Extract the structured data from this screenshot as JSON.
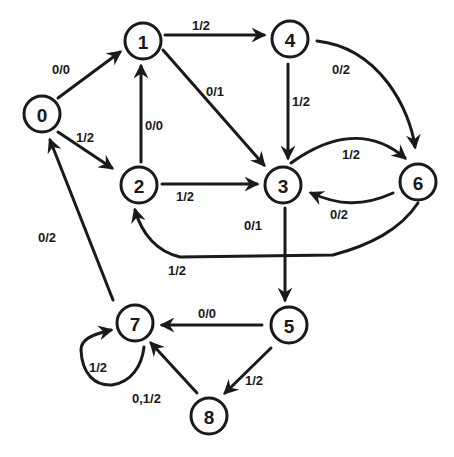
{
  "diagram": {
    "type": "directed-graph",
    "nodes": [
      {
        "id": "0",
        "label": "0",
        "x": 42,
        "y": 114
      },
      {
        "id": "1",
        "label": "1",
        "x": 143,
        "y": 41
      },
      {
        "id": "2",
        "label": "2",
        "x": 139,
        "y": 185
      },
      {
        "id": "3",
        "label": "3",
        "x": 283,
        "y": 185
      },
      {
        "id": "4",
        "label": "4",
        "x": 290,
        "y": 39
      },
      {
        "id": "5",
        "label": "5",
        "x": 289,
        "y": 325
      },
      {
        "id": "6",
        "label": "6",
        "x": 418,
        "y": 182
      },
      {
        "id": "7",
        "label": "7",
        "x": 135,
        "y": 323
      },
      {
        "id": "8",
        "label": "8",
        "x": 209,
        "y": 416
      }
    ],
    "edges": [
      {
        "from": "0",
        "to": "1",
        "label": "0/0"
      },
      {
        "from": "0",
        "to": "2",
        "label": "1/2"
      },
      {
        "from": "1",
        "to": "4",
        "label": "1/2"
      },
      {
        "from": "1",
        "to": "3",
        "label": "0/1"
      },
      {
        "from": "2",
        "to": "1",
        "label": "0/0"
      },
      {
        "from": "2",
        "to": "3",
        "label": "1/2"
      },
      {
        "from": "4",
        "to": "3",
        "label": "1/2"
      },
      {
        "from": "4",
        "to": "6",
        "label": "0/2"
      },
      {
        "from": "3",
        "to": "6",
        "label": "1/2"
      },
      {
        "from": "6",
        "to": "3",
        "label": "0/2"
      },
      {
        "from": "6",
        "to": "2",
        "label": "1/2"
      },
      {
        "from": "3",
        "to": "5",
        "label": "0/1"
      },
      {
        "from": "5",
        "to": "7",
        "label": "0/0"
      },
      {
        "from": "5",
        "to": "8",
        "label": "1/2"
      },
      {
        "from": "8",
        "to": "7",
        "label": "0,1/2"
      },
      {
        "from": "7",
        "to": "7",
        "label": "1/2"
      },
      {
        "from": "7",
        "to": "0",
        "label": "0/2"
      }
    ],
    "colors": {
      "stroke": "#1a1a1a",
      "background": "#ffffff"
    }
  }
}
